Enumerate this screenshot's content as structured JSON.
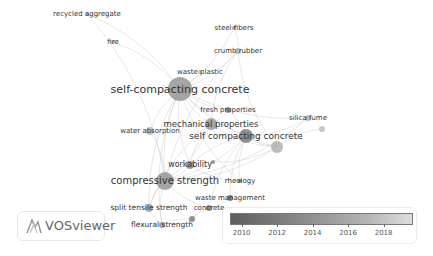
{
  "app": {
    "name": "VOSviewer"
  },
  "chart_data": {
    "type": "network",
    "title": "",
    "overlay_colorbar": {
      "min": 2009.4,
      "max": 2019.6,
      "ticks": [
        2010,
        2012,
        2014,
        2016,
        2018
      ]
    },
    "nodes": [
      {
        "id": "recycled_aggregate",
        "label": "recycled aggregate",
        "x": 87,
        "y": 14,
        "r": 2,
        "year": 2017,
        "font": 7
      },
      {
        "id": "fire",
        "label": "fire",
        "x": 113,
        "y": 42,
        "r": 2,
        "year": 2017,
        "font": 7
      },
      {
        "id": "steel_fibers",
        "label": "steel fibers",
        "x": 234,
        "y": 28,
        "r": 2,
        "year": 2014,
        "font": 7
      },
      {
        "id": "crumb_rubber",
        "label": "crumb rubber",
        "x": 238,
        "y": 51,
        "r": 3,
        "year": 2016,
        "font": 7
      },
      {
        "id": "waste_plastic",
        "label": "waste plastic",
        "x": 200,
        "y": 72,
        "r": 2,
        "year": 2017,
        "font": 7
      },
      {
        "id": "self_compacting_concrete_h",
        "label": "self-compacting concrete",
        "x": 180,
        "y": 89,
        "r": 12,
        "year": 2014,
        "font": 11
      },
      {
        "id": "fresh_properties",
        "label": "fresh properties",
        "x": 228,
        "y": 110,
        "r": 3,
        "year": 2013,
        "font": 7
      },
      {
        "id": "mechanical_properties",
        "label": "mechanical properties",
        "x": 211,
        "y": 124,
        "r": 6,
        "year": 2014,
        "font": 8.5
      },
      {
        "id": "water_absorption",
        "label": "water absorption",
        "x": 150,
        "y": 131,
        "r": 4,
        "year": 2017,
        "font": 7
      },
      {
        "id": "silica_fume",
        "label": "silica fume",
        "x": 308,
        "y": 118,
        "r": 3,
        "year": 2016,
        "font": 7
      },
      {
        "id": "silica_dot2",
        "label": "",
        "x": 322,
        "y": 129,
        "r": 3,
        "year": 2017,
        "font": 0
      },
      {
        "id": "self_compacting_concrete",
        "label": "self compacting concrete",
        "x": 246,
        "y": 136,
        "r": 7,
        "year": 2012,
        "font": 9
      },
      {
        "id": "scc_node2",
        "label": "",
        "x": 277,
        "y": 147,
        "r": 6,
        "year": 2016,
        "font": 0
      },
      {
        "id": "workability",
        "label": "workability",
        "x": 190,
        "y": 165,
        "r": 4,
        "year": 2013,
        "font": 8
      },
      {
        "id": "workability_dot",
        "label": "",
        "x": 213,
        "y": 162,
        "r": 2,
        "year": 2013,
        "font": 0
      },
      {
        "id": "compressive_strength",
        "label": "compressive strength",
        "x": 165,
        "y": 181,
        "r": 9,
        "year": 2014,
        "font": 10
      },
      {
        "id": "rheology",
        "label": "rheology",
        "x": 240,
        "y": 181,
        "r": 2,
        "year": 2012,
        "font": 7
      },
      {
        "id": "waste_management",
        "label": "waste management",
        "x": 230,
        "y": 198,
        "r": 3,
        "year": 2011,
        "font": 7
      },
      {
        "id": "split_tensile_strength",
        "label": "split tensile strength",
        "x": 149,
        "y": 208,
        "r": 4,
        "year": 2015,
        "font": 7.5
      },
      {
        "id": "concrete",
        "label": "concrete",
        "x": 209,
        "y": 208,
        "r": 3,
        "year": 2012,
        "font": 7
      },
      {
        "id": "concrete_dot",
        "label": "",
        "x": 192,
        "y": 219,
        "r": 3,
        "year": 2012,
        "font": 0
      },
      {
        "id": "flexural_strength",
        "label": "flexural strength",
        "x": 162,
        "y": 225,
        "r": 3,
        "year": 2014,
        "font": 7.5
      }
    ],
    "edges": [
      [
        "self_compacting_concrete_h",
        "recycled_aggregate"
      ],
      [
        "self_compacting_concrete_h",
        "fire"
      ],
      [
        "self_compacting_concrete_h",
        "steel_fibers"
      ],
      [
        "self_compacting_concrete_h",
        "crumb_rubber"
      ],
      [
        "self_compacting_concrete_h",
        "waste_plastic"
      ],
      [
        "self_compacting_concrete_h",
        "fresh_properties"
      ],
      [
        "self_compacting_concrete_h",
        "mechanical_properties"
      ],
      [
        "self_compacting_concrete_h",
        "water_absorption"
      ],
      [
        "self_compacting_concrete_h",
        "silica_fume"
      ],
      [
        "self_compacting_concrete_h",
        "self_compacting_concrete"
      ],
      [
        "self_compacting_concrete_h",
        "compressive_strength"
      ],
      [
        "self_compacting_concrete_h",
        "workability"
      ],
      [
        "self_compacting_concrete_h",
        "split_tensile_strength"
      ],
      [
        "self_compacting_concrete_h",
        "flexural_strength"
      ],
      [
        "self_compacting_concrete_h",
        "scc_node2"
      ],
      [
        "self_compacting_concrete_h",
        "rheology"
      ],
      [
        "crumb_rubber",
        "steel_fibers"
      ],
      [
        "crumb_rubber",
        "mechanical_properties"
      ],
      [
        "crumb_rubber",
        "compressive_strength"
      ],
      [
        "crumb_rubber",
        "scc_node2"
      ],
      [
        "compressive_strength",
        "water_absorption"
      ],
      [
        "compressive_strength",
        "split_tensile_strength"
      ],
      [
        "compressive_strength",
        "flexural_strength"
      ],
      [
        "compressive_strength",
        "workability"
      ],
      [
        "compressive_strength",
        "mechanical_properties"
      ],
      [
        "compressive_strength",
        "self_compacting_concrete"
      ],
      [
        "compressive_strength",
        "scc_node2"
      ],
      [
        "compressive_strength",
        "concrete"
      ],
      [
        "compressive_strength",
        "silica_fume"
      ],
      [
        "compressive_strength",
        "recycled_aggregate"
      ],
      [
        "self_compacting_concrete",
        "rheology"
      ],
      [
        "self_compacting_concrete",
        "workability"
      ],
      [
        "self_compacting_concrete",
        "fresh_properties"
      ],
      [
        "self_compacting_concrete",
        "silica_fume"
      ],
      [
        "self_compacting_concrete",
        "scc_node2"
      ],
      [
        "self_compacting_concrete",
        "concrete"
      ],
      [
        "self_compacting_concrete",
        "waste_management"
      ],
      [
        "mechanical_properties",
        "fresh_properties"
      ],
      [
        "mechanical_properties",
        "workability"
      ],
      [
        "mechanical_properties",
        "scc_node2"
      ],
      [
        "mechanical_properties",
        "split_tensile_strength"
      ],
      [
        "split_tensile_strength",
        "flexural_strength"
      ],
      [
        "concrete",
        "waste_management"
      ],
      [
        "concrete",
        "concrete_dot"
      ],
      [
        "concrete_dot",
        "flexural_strength"
      ],
      [
        "workability",
        "rheology"
      ],
      [
        "workability_dot",
        "scc_node2"
      ],
      [
        "silica_dot2",
        "scc_node2"
      ]
    ]
  },
  "legend": {
    "ticks": [
      "2010",
      "2012",
      "2014",
      "2016",
      "2018"
    ]
  }
}
